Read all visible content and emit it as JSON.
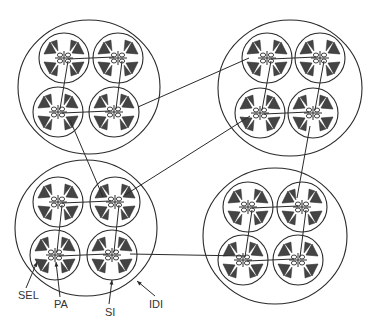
{
  "labels": {
    "sel": "SEL",
    "pa": "PA",
    "si": "SI",
    "idi": "IDI"
  },
  "colors": {
    "stroke": "#2a2a2a",
    "fill": "#444444",
    "background": "#ffffff"
  },
  "clusters": [
    {
      "name": "top-left",
      "cx": 89,
      "cy": 87,
      "rx": 71,
      "ry": 67,
      "subs": [
        [
          64,
          58
        ],
        [
          118,
          58
        ],
        [
          58,
          112
        ],
        [
          114,
          112
        ]
      ]
    },
    {
      "name": "top-right",
      "cx": 290,
      "cy": 88,
      "rx": 72,
      "ry": 68,
      "subs": [
        [
          267,
          58
        ],
        [
          320,
          58
        ],
        [
          260,
          113
        ],
        [
          313,
          113
        ]
      ]
    },
    {
      "name": "bottom-left",
      "cx": 86,
      "cy": 228,
      "rx": 71,
      "ry": 68,
      "subs": [
        [
          58,
          202
        ],
        [
          115,
          202
        ],
        [
          55,
          255
        ],
        [
          112,
          255
        ]
      ]
    },
    {
      "name": "bottom-right",
      "cx": 275,
      "cy": 236,
      "rx": 72,
      "ry": 68,
      "subs": [
        [
          248,
          207
        ],
        [
          302,
          207
        ],
        [
          243,
          260
        ],
        [
          298,
          260
        ]
      ]
    }
  ],
  "links": [
    [
      138,
      107,
      249,
      58
    ],
    [
      70,
      120,
      103,
      197
    ],
    [
      125,
      195,
      250,
      116
    ],
    [
      310,
      126,
      297,
      198
    ],
    [
      130,
      254,
      245,
      256
    ]
  ]
}
